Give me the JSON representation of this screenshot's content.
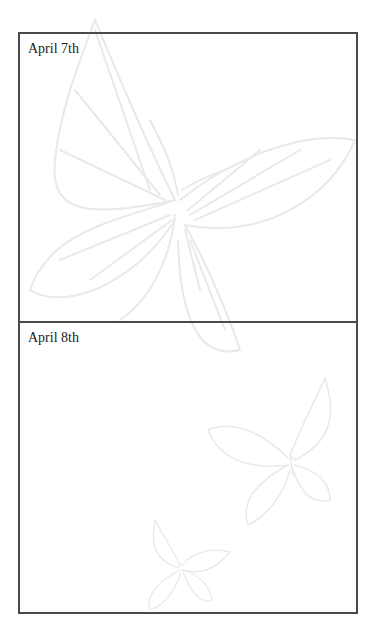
{
  "journal": {
    "entries": [
      {
        "date": "April 7th"
      },
      {
        "date": "April 8th"
      }
    ]
  },
  "decoration": {
    "background": "butterfly-illustrations",
    "stroke_color": "#e6e6e6"
  }
}
